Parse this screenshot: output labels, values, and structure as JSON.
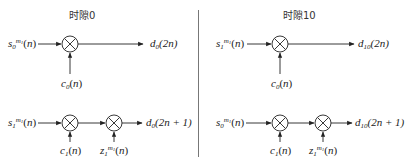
{
  "panels": [
    {
      "title": "时隙0",
      "row1": {
        "input": {
          "base": "s",
          "sub": "0",
          "sup": "m",
          "supsub": "1",
          "arg": "(n)"
        },
        "code": {
          "base": "c",
          "sub": "0",
          "arg": "(n)"
        },
        "output": {
          "base": "d",
          "sub": "0",
          "arg": "(2n)"
        }
      },
      "row2": {
        "input": {
          "base": "s",
          "sub": "1",
          "sup": "m",
          "supsub": "1",
          "arg": "(n)"
        },
        "code": {
          "base": "c",
          "sub": "1",
          "arg": "(n)"
        },
        "scramble": {
          "base": "z",
          "sub": "1",
          "sup": "m",
          "supsub": "1",
          "arg": "(n)"
        },
        "output": {
          "base": "d",
          "sub": "0",
          "arg": "(2n + 1)"
        }
      }
    },
    {
      "title": "时隙10",
      "row1": {
        "input": {
          "base": "s",
          "sub": "1",
          "sup": "m",
          "supsub": "1",
          "arg": "(n)"
        },
        "code": {
          "base": "c",
          "sub": "0",
          "arg": "(n)"
        },
        "output": {
          "base": "d",
          "sub": "10",
          "arg": "(2n)"
        }
      },
      "row2": {
        "input": {
          "base": "s",
          "sub": "0",
          "sup": "m",
          "supsub": "1",
          "arg": "(n)"
        },
        "code": {
          "base": "c",
          "sub": "1",
          "arg": "(n)"
        },
        "scramble": {
          "base": "z",
          "sub": "1",
          "sup": "m",
          "supsub": "1",
          "arg": "(n)"
        },
        "output": {
          "base": "d",
          "sub": "10",
          "arg": "(2n + 1)"
        }
      }
    }
  ],
  "symbols": {
    "multiplier": "multiplier-icon"
  },
  "colors": {
    "line": "#333333",
    "divider": "#777777"
  }
}
